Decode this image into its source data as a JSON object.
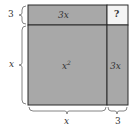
{
  "diagram": {
    "type": "completing-the-square",
    "colors": {
      "fill": "#a8a8a8",
      "unknown_fill": "#f4f4f4",
      "stroke": "#2a2a2a"
    },
    "regions": {
      "top_left": "3x",
      "top_right": "?",
      "bottom_left": "x",
      "bottom_left_exp": "2",
      "bottom_right": "3x"
    },
    "left_labels": {
      "top": "3",
      "bottom": "x"
    },
    "bottom_labels": {
      "left": "x",
      "right": "3"
    }
  }
}
